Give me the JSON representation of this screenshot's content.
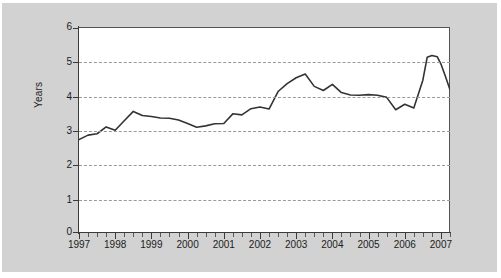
{
  "chart_data": {
    "type": "line",
    "title": "",
    "subtitle": "",
    "xlabel": "",
    "ylabel": "Years",
    "xlim": [
      1997.0,
      2007.25
    ],
    "ylim": [
      0,
      6
    ],
    "grid": true,
    "grid_axis": "y",
    "legend": false,
    "legend_position": "none",
    "line_color": "#333333",
    "y_ticks": [
      0,
      1,
      2,
      3,
      4,
      5,
      6
    ],
    "y_tick_labels": [
      "0",
      "1",
      "2",
      "3",
      "4",
      "5",
      "6"
    ],
    "x_ticks": [
      1997,
      1998,
      1999,
      2000,
      2001,
      2002,
      2003,
      2004,
      2005,
      2006,
      2007
    ],
    "x_tick_labels": [
      "1997",
      "1998",
      "1999",
      "2000",
      "2001",
      "2002",
      "2003",
      "2004",
      "2005",
      "2006",
      "2007"
    ],
    "minor_x_ticks_per_year": 4,
    "series": [
      {
        "name": "Years",
        "x": [
          1997.0,
          1997.25,
          1997.5,
          1997.75,
          1998.0,
          1998.25,
          1998.5,
          1998.75,
          1999.0,
          1999.25,
          1999.5,
          1999.75,
          2000.0,
          2000.25,
          2000.5,
          2000.75,
          2001.0,
          2001.25,
          2001.5,
          2001.75,
          2002.0,
          2002.25,
          2002.5,
          2002.75,
          2003.0,
          2003.25,
          2003.5,
          2003.75,
          2004.0,
          2004.25,
          2004.5,
          2004.75,
          2005.0,
          2005.25,
          2005.5,
          2005.75,
          2006.0,
          2006.25,
          2006.5,
          2006.75,
          2007.0,
          2007.25
        ],
        "values": [
          2.75,
          2.88,
          2.92,
          3.12,
          3.02,
          3.3,
          3.57,
          3.45,
          3.42,
          3.38,
          3.37,
          3.32,
          3.22,
          3.11,
          3.15,
          3.21,
          3.22,
          3.5,
          3.47,
          3.65,
          3.7,
          3.64,
          4.15,
          4.38,
          4.55,
          4.66,
          4.3,
          4.18,
          4.36,
          4.12,
          4.05,
          4.04,
          4.06,
          4.04,
          3.98,
          3.62,
          3.78,
          3.67,
          4.02,
          4.3,
          4.45,
          4.48
        ]
      }
    ],
    "series_tail": {
      "note": "final rise and fall",
      "x": [
        2006.5,
        2006.62,
        2006.75,
        2006.9,
        2007.0,
        2007.12,
        2007.25
      ],
      "values": [
        4.48,
        5.15,
        5.2,
        5.16,
        4.95,
        4.6,
        4.2
      ]
    },
    "annotations": [],
    "value_min": 2.75,
    "value_max": 5.2,
    "value_first": 2.75,
    "value_last": 4.2
  },
  "figure": {
    "background_color": "#d2d2d2",
    "plot_background_color": "#ffffff",
    "axis_color": "#3a3a3a",
    "gridline_color": "#9a9a9a"
  }
}
